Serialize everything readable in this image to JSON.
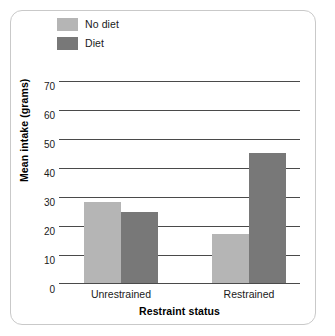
{
  "chart_data": {
    "type": "bar",
    "title": "",
    "xlabel": "Restraint status",
    "ylabel": "Mean intake (grams)",
    "categories": [
      "Unrestrained",
      "Restrained"
    ],
    "series": [
      {
        "name": "No diet",
        "color": "#b5b5b5",
        "values": [
          28,
          17
        ]
      },
      {
        "name": "Diet",
        "color": "#787878",
        "values": [
          24.5,
          45
        ]
      }
    ],
    "ylim": [
      0,
      70
    ],
    "yticks": [
      0,
      10,
      20,
      30,
      40,
      50,
      60,
      70
    ],
    "ytick_labels": [
      "0",
      "10",
      "20",
      "30",
      "40",
      "50",
      "60",
      "70"
    ],
    "grid": true,
    "gridline_color": "#4a4a4a",
    "legend_position": "top-left",
    "frame_color": "#c9c9c9",
    "background": "#ffffff"
  }
}
